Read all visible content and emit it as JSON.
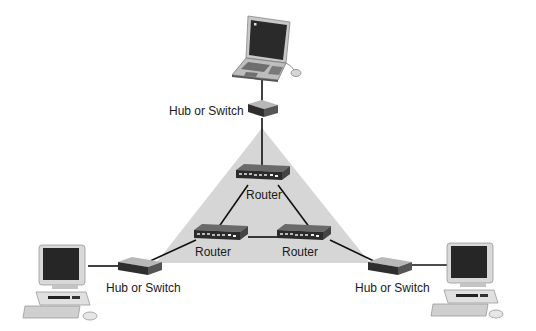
{
  "diagram": {
    "title": "",
    "backbone": {
      "shape": "triangle",
      "fill": "#d6d6d6",
      "points": [
        [
          262,
          128
        ],
        [
          156,
          263
        ],
        [
          370,
          263
        ]
      ]
    },
    "nodes": {
      "laptop": {
        "type": "laptop",
        "x": 232,
        "y": 12
      },
      "hub_top": {
        "type": "hub",
        "label": "Hub or Switch",
        "x": 247,
        "y": 102
      },
      "router_top": {
        "type": "router",
        "label": "Router",
        "x": 233,
        "y": 165
      },
      "router_left": {
        "type": "router",
        "label": "Router",
        "x": 193,
        "y": 225
      },
      "router_right": {
        "type": "router",
        "label": "Router",
        "x": 276,
        "y": 225
      },
      "hub_left": {
        "type": "hub",
        "label": "Hub or Switch",
        "x": 117,
        "y": 258
      },
      "hub_right": {
        "type": "hub",
        "label": "Hub or Switch",
        "x": 368,
        "y": 257
      },
      "pc_left": {
        "type": "desktop-pc",
        "x": 32,
        "y": 243
      },
      "pc_right": {
        "type": "desktop-pc",
        "x": 440,
        "y": 241
      }
    },
    "links": [
      [
        "laptop",
        "hub_top"
      ],
      [
        "hub_top",
        "router_top"
      ],
      [
        "router_top",
        "router_left"
      ],
      [
        "router_top",
        "router_right"
      ],
      [
        "router_left",
        "router_right"
      ],
      [
        "router_left",
        "hub_left"
      ],
      [
        "router_right",
        "hub_right"
      ],
      [
        "hub_left",
        "pc_left"
      ],
      [
        "hub_right",
        "pc_right"
      ]
    ],
    "labels": {
      "hub_top": "Hub or Switch",
      "hub_left": "Hub or Switch",
      "hub_right": "Hub or Switch",
      "router_top": "Router",
      "router_left": "Router",
      "router_right": "Router"
    },
    "colors": {
      "line": "#111111",
      "device_dark": "#3a3a3a",
      "device_light": "#cfcfcf",
      "screen": "#2a2a2a",
      "triangle": "#d6d6d6"
    }
  }
}
